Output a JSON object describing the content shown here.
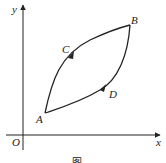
{
  "diagram": {
    "type": "cycle-path-on-axes",
    "axes": {
      "x_label": "x",
      "y_label": "y",
      "origin_label": "O"
    },
    "points": [
      {
        "label": "A"
      },
      {
        "label": "B"
      },
      {
        "label": "C"
      },
      {
        "label": "D"
      }
    ],
    "path_description": "closed loop A -> C -> B -> D -> A with direction arrows at C and D",
    "caption": "图..."
  },
  "colors": {
    "stroke": "#222222",
    "background": "#ffffff"
  }
}
